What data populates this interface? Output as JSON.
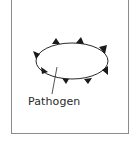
{
  "diagram": {
    "label": "Pathogen",
    "colors": {
      "outline": "#2a2a2a",
      "frame": "#8c8c8c",
      "background": "#ffffff"
    },
    "shape": {
      "type": "ellipse",
      "cx": 72,
      "cy": 61,
      "rx": 36,
      "ry": 18,
      "spikes": 8
    }
  }
}
